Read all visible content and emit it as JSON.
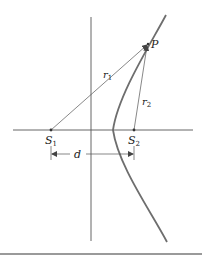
{
  "figure": {
    "type": "hyperbola-foci-diagram",
    "colors": {
      "curve": "#6e6e6e",
      "axes": "#555555",
      "lines": "#555555",
      "text": "#222222",
      "bottom_rule": "#9a9a9a"
    },
    "labels": {
      "point": "P",
      "r1": {
        "base": "r",
        "sub": "1"
      },
      "r2": {
        "base": "r",
        "sub": "2"
      },
      "s1": {
        "base": "S",
        "sub": "1"
      },
      "s2": {
        "base": "S",
        "sub": "2"
      },
      "distance": "d"
    }
  }
}
